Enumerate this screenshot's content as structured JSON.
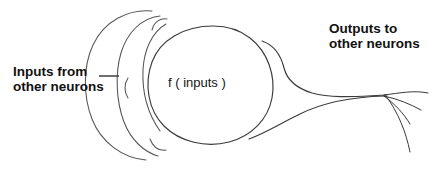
{
  "figure": {
    "background_color": "#ffffff",
    "ink_color": "#3a3a3a",
    "text_color": "#111111"
  },
  "labels": {
    "inputs_line1": "Inputs from",
    "inputs_line2": "other neurons",
    "outputs_line1": "Outputs to",
    "outputs_line2": "other neurons",
    "soma_function": "f ( inputs )"
  },
  "parts": {
    "dendrites_name": "dendrites",
    "soma_name": "cell body",
    "axon_name": "axon",
    "terminals_name": "axon terminals"
  }
}
